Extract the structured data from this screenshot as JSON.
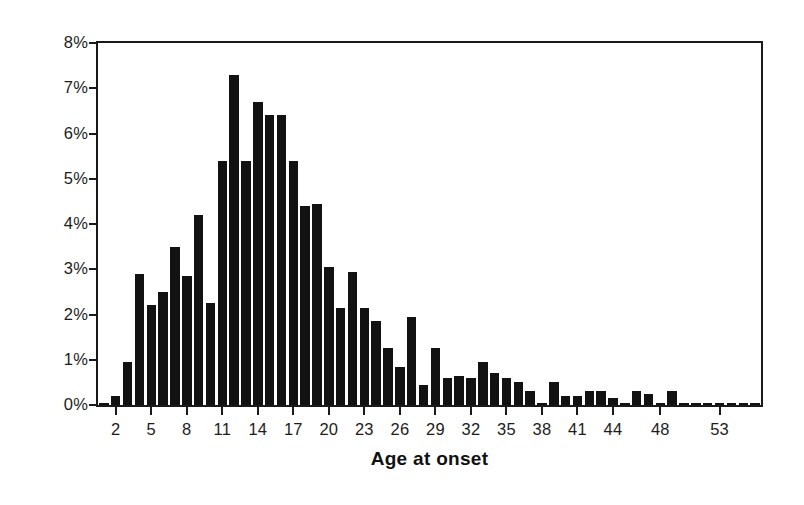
{
  "chart_data": {
    "type": "bar",
    "title": "",
    "subtitle": "",
    "xlabel": "Age at onset",
    "ylabel": "",
    "ylim": [
      0,
      8
    ],
    "xlim": [
      0.5,
      56.5
    ],
    "grid": false,
    "legend": null,
    "y_tick_labels": [
      "8%",
      "7%",
      "6%",
      "5%",
      "4%",
      "3%",
      "2%",
      "1%",
      "0%"
    ],
    "y_tick_values": [
      8,
      7,
      6,
      5,
      4,
      3,
      2,
      1,
      0
    ],
    "x_tick_labels": [
      "2",
      "5",
      "8",
      "11",
      "14",
      "17",
      "20",
      "23",
      "26",
      "29",
      "32",
      "35",
      "38",
      "41",
      "44",
      "48",
      "53"
    ],
    "x_tick_values": [
      2,
      5,
      8,
      11,
      14,
      17,
      20,
      23,
      26,
      29,
      32,
      35,
      38,
      41,
      44,
      48,
      53
    ],
    "categories": [
      1,
      2,
      3,
      4,
      5,
      6,
      7,
      8,
      9,
      10,
      11,
      12,
      13,
      14,
      15,
      16,
      17,
      18,
      19,
      20,
      21,
      22,
      23,
      24,
      25,
      26,
      27,
      28,
      29,
      30,
      31,
      32,
      33,
      34,
      35,
      36,
      37,
      38,
      39,
      40,
      41,
      42,
      43,
      44,
      45,
      46,
      47,
      48,
      49,
      50,
      51,
      52,
      53,
      54,
      55,
      56
    ],
    "values": [
      0.05,
      0.2,
      0.95,
      2.9,
      2.2,
      2.5,
      3.5,
      2.85,
      4.2,
      2.25,
      5.4,
      7.3,
      5.4,
      6.7,
      6.4,
      6.4,
      5.4,
      4.4,
      4.45,
      3.05,
      2.15,
      2.95,
      2.15,
      1.85,
      1.25,
      0.85,
      1.95,
      0.45,
      1.25,
      0.6,
      0.65,
      0.6,
      0.95,
      0.7,
      0.6,
      0.5,
      0.3,
      0.05,
      0.5,
      0.2,
      0.2,
      0.3,
      0.3,
      0.15,
      0.05,
      0.3,
      0.25,
      0.05,
      0.3,
      0.05,
      0.05,
      0.05,
      0.05,
      0.05,
      0.05,
      0.05
    ],
    "value_unit": "%",
    "bar_color": "#121212",
    "axis_color": "#1a1a1a",
    "background_color": "#ffffff"
  },
  "axes": {
    "x_title": "Age at onset"
  }
}
